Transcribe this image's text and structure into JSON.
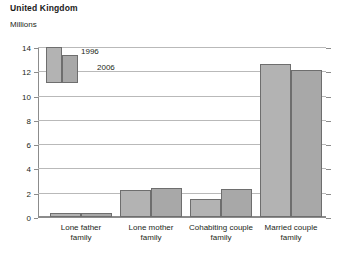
{
  "chart_data": {
    "type": "bar",
    "title": "United Kingdom",
    "subtitle": "Millions",
    "xlabel": "",
    "ylabel": "Millions",
    "ylim": [
      0,
      14
    ],
    "yticks": [
      0,
      2,
      4,
      6,
      8,
      10,
      12,
      14
    ],
    "ytick_labels": [
      "0",
      "2",
      "4",
      "6",
      "8",
      "10",
      "12",
      "14"
    ],
    "grid": true,
    "legend_position": "top-left-inside",
    "categories": [
      "Lone father family",
      "Lone mother family",
      "Cohabiting couple family",
      "Married couple family"
    ],
    "category_lines": [
      [
        "Lone father",
        "family"
      ],
      [
        "Lone mother",
        "family"
      ],
      [
        "Cohabiting couple",
        "family"
      ],
      [
        "Married couple",
        "family"
      ]
    ],
    "series": [
      {
        "name": "1996",
        "color": "#b3b3b3",
        "values": [
          0.3,
          2.2,
          1.5,
          12.6
        ]
      },
      {
        "name": "2006",
        "color": "#a8a8a8",
        "values": [
          0.3,
          2.4,
          2.3,
          12.1
        ]
      }
    ]
  },
  "legend": {
    "items": [
      {
        "label": "1996"
      },
      {
        "label": "2006"
      }
    ]
  },
  "axis": {
    "y": {
      "t0": "0",
      "t2": "2",
      "t4": "4",
      "t6": "6",
      "t8": "8",
      "t10": "10",
      "t12": "12",
      "t14": "14"
    }
  },
  "categories": {
    "c0l0": "Lone father",
    "c0l1": "family",
    "c1l0": "Lone mother",
    "c1l1": "family",
    "c2l0": "Cohabiting couple",
    "c2l1": "family",
    "c3l0": "Married couple",
    "c3l1": "family"
  },
  "header": {
    "title": "United Kingdom",
    "subtitle": "Millions"
  },
  "colors": {
    "series_1996": "#b3b3b3",
    "series_2006": "#a8a8a8",
    "grid": "#b9b9b9",
    "axis": "#8c8c8c",
    "text": "#231f20",
    "background": "#ffffff"
  }
}
